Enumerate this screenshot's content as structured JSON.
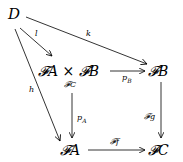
{
  "diagram": {
    "type": "commutative-diagram",
    "nodes": {
      "D": "D",
      "product": "𝓕A × 𝓕B",
      "product_sub": "𝓕C",
      "FB": "𝓕B",
      "FA": "𝓕A",
      "FC": "𝓕C"
    },
    "arrows": {
      "l": "l",
      "k": "k",
      "h": "h",
      "pB": "p",
      "pB_sub": "B",
      "pA": "p",
      "pA_sub": "A",
      "Fg": "𝓕g",
      "Ff": "𝓕f"
    },
    "edges": [
      {
        "from": "D",
        "to": "product",
        "label": "l"
      },
      {
        "from": "D",
        "to": "FB",
        "label": "k"
      },
      {
        "from": "D",
        "to": "FA",
        "label": "h"
      },
      {
        "from": "product",
        "to": "FB",
        "label": "p_B"
      },
      {
        "from": "product",
        "to": "FA",
        "label": "p_A"
      },
      {
        "from": "FB",
        "to": "FC",
        "label": "𝓕g"
      },
      {
        "from": "FA",
        "to": "FC",
        "label": "𝓕f"
      }
    ]
  }
}
